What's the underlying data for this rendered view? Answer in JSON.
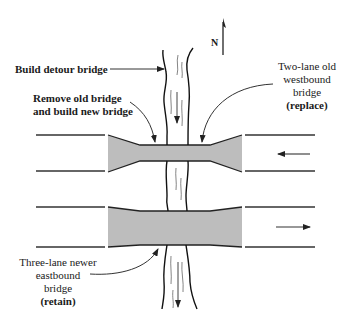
{
  "diagram": {
    "type": "bridge-replacement-plan",
    "compass": {
      "label": "N"
    },
    "labels": {
      "detour": "Build detour bridge",
      "remove_line1": "Remove old bridge",
      "remove_line2": "and build new bridge",
      "westbound_line1": "Two-lane old",
      "westbound_line2": "westbound",
      "westbound_line3": "bridge",
      "westbound_action": "(replace)",
      "eastbound_line1": "Three-lane newer",
      "eastbound_line2": "eastbound",
      "eastbound_line3": "bridge",
      "eastbound_action": "(retain)"
    },
    "traffic": {
      "westbound_direction": "left",
      "eastbound_direction": "right",
      "river_flow_direction": "down"
    },
    "colors": {
      "bridge_fill": "#bdbdbd",
      "line": "#222222",
      "river_texture": "#555555",
      "background": "#ffffff"
    }
  }
}
